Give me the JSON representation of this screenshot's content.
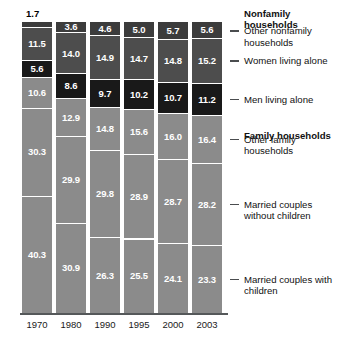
{
  "chart_data": {
    "type": "bar",
    "title": "",
    "subtitle": "",
    "xlabel": "",
    "ylabel": "",
    "ylim": [
      0,
      100
    ],
    "grid": false,
    "legend_position": "right",
    "stacked": true,
    "categories": [
      "1970",
      "1980",
      "1990",
      "1995",
      "2000",
      "2003"
    ],
    "series": [
      {
        "name": "Other nonfamily households",
        "group": "Nonfamily households",
        "color": "#3c3c3c",
        "values": [
          1.7,
          3.6,
          4.6,
          5.0,
          5.7,
          5.6
        ]
      },
      {
        "name": "Women living alone",
        "group": "Nonfamily households",
        "color": "#4d4d4d",
        "values": [
          11.5,
          14.0,
          14.9,
          14.7,
          14.8,
          15.2
        ]
      },
      {
        "name": "Men living alone",
        "group": "Nonfamily households",
        "color": "#191919",
        "values": [
          5.6,
          8.6,
          9.7,
          10.2,
          10.7,
          11.2
        ]
      },
      {
        "name": "Other family households",
        "group": "Family households",
        "color": "#8b8b8b",
        "values": [
          10.6,
          12.9,
          14.8,
          15.6,
          16.0,
          16.4
        ]
      },
      {
        "name": "Married couples without children",
        "group": "Family households",
        "color": "#8b8b8b",
        "values": [
          30.3,
          29.9,
          29.8,
          28.9,
          28.7,
          28.2
        ]
      },
      {
        "name": "Married couples with children",
        "group": "Family households",
        "color": "#8b8b8b",
        "values": [
          40.3,
          30.9,
          26.3,
          25.5,
          24.1,
          23.3
        ]
      }
    ]
  },
  "legend": {
    "entries": [
      {
        "label": "Nonfamily households",
        "bold": true,
        "dash": false
      },
      {
        "label": "Other nonfamily households",
        "bold": false,
        "dash": true
      },
      {
        "label": "Women living alone",
        "bold": false,
        "dash": true
      },
      {
        "label": "Men living alone",
        "bold": false,
        "dash": true
      },
      {
        "label": "Family households",
        "bold": true,
        "dash": false
      },
      {
        "label": "Other family households",
        "bold": false,
        "dash": true
      },
      {
        "label": "Married couples without children",
        "bold": false,
        "dash": true
      },
      {
        "label": "Married couples with children",
        "bold": false,
        "dash": true
      }
    ]
  },
  "axis": {
    "tick_labels": [
      "1970",
      "1980",
      "1990",
      "1995",
      "2000",
      "2003"
    ]
  },
  "outside_labels": [
    {
      "text": "1.7",
      "series": "Other nonfamily households",
      "category": "1970"
    }
  ],
  "colors": {
    "segment_dark": "#3c3c3c",
    "segment_mid_dark": "#4d4d4d",
    "segment_black": "#191919",
    "segment_gray": "#8b8b8b",
    "baseline": "#55585a",
    "value_text": "#ffffff",
    "label_text": "#111111"
  }
}
